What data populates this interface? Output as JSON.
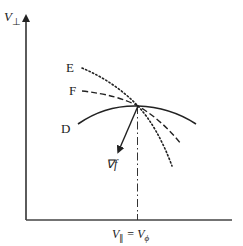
{
  "diagram": {
    "y_axis_label": "V",
    "y_axis_sub": "⊥",
    "x_axis_label_left": "V",
    "x_axis_label_left_sub": "∥",
    "x_axis_label_eq": " = ",
    "x_axis_label_right": "V",
    "x_axis_label_right_sub": "ϕ",
    "curves": [
      {
        "label": "E",
        "style": "dotted"
      },
      {
        "label": "F",
        "style": "dashed"
      },
      {
        "label": "D",
        "style": "solid"
      }
    ],
    "gradient_label": "∇f",
    "colors": {
      "stroke": "#222222",
      "background": "#ffffff"
    }
  }
}
